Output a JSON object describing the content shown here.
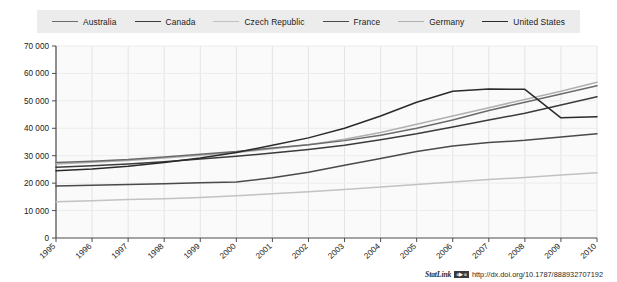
{
  "legend": {
    "items": [
      {
        "label": "Australia",
        "color": "#6b6b6b"
      },
      {
        "label": "Canada",
        "color": "#3b3b3b"
      },
      {
        "label": "Czech Republic",
        "color": "#c2c2c2"
      },
      {
        "label": "France",
        "color": "#4a4a4a"
      },
      {
        "label": "Germany",
        "color": "#b0b0b0"
      },
      {
        "label": "United States",
        "color": "#2a2a2a"
      }
    ]
  },
  "footer": {
    "statlink_word": "StatLink",
    "statlink_badge": "≡▶≡",
    "url": "http://dx.doi.org/10.1787/888932707192"
  },
  "chart_data": {
    "type": "line",
    "title": "",
    "xlabel": "",
    "ylabel": "",
    "grid": true,
    "legend_position": "top",
    "ylim": [
      0,
      70000
    ],
    "yticks": [
      0,
      10000,
      20000,
      30000,
      40000,
      50000,
      60000,
      70000
    ],
    "ytick_labels": [
      "0",
      "10 000",
      "20 000",
      "30 000",
      "40 000",
      "50 000",
      "60 000",
      "70 000"
    ],
    "categories": [
      "1995",
      "1996",
      "1997",
      "1998",
      "1999",
      "2000",
      "2001",
      "2002",
      "2003",
      "2004",
      "2005",
      "2006",
      "2007",
      "2008",
      "2009",
      "2010"
    ],
    "series": [
      {
        "name": "Australia",
        "color": "#6b6b6b",
        "values": [
          27500,
          28000,
          28600,
          29500,
          30500,
          31500,
          32800,
          34000,
          35500,
          37500,
          40000,
          43000,
          46500,
          49500,
          52500,
          55500
        ]
      },
      {
        "name": "Canada",
        "color": "#3b3b3b",
        "values": [
          25800,
          26300,
          27000,
          27800,
          28800,
          29800,
          31000,
          32300,
          33800,
          35800,
          38000,
          40500,
          43000,
          45500,
          48500,
          51500
        ]
      },
      {
        "name": "Czech Republic",
        "color": "#c2c2c2",
        "values": [
          13200,
          13600,
          14000,
          14300,
          14800,
          15400,
          16100,
          16900,
          17700,
          18600,
          19500,
          20400,
          21300,
          22100,
          23000,
          23800
        ]
      },
      {
        "name": "France",
        "color": "#4a4a4a",
        "values": [
          19000,
          19200,
          19500,
          19800,
          20100,
          20400,
          22000,
          24000,
          26500,
          29000,
          31500,
          33500,
          34800,
          35600,
          36800,
          38000
        ]
      },
      {
        "name": "Germany",
        "color": "#b0b0b0",
        "values": [
          27000,
          27600,
          28300,
          29200,
          30200,
          31200,
          32500,
          34000,
          36000,
          38500,
          41500,
          44500,
          47500,
          50500,
          53500,
          56800
        ]
      },
      {
        "name": "United States",
        "color": "#2a2a2a",
        "values": [
          24500,
          25200,
          26200,
          27500,
          29200,
          31200,
          33800,
          36500,
          40000,
          44500,
          49500,
          53500,
          54300,
          54200,
          43800,
          44200
        ]
      }
    ]
  }
}
